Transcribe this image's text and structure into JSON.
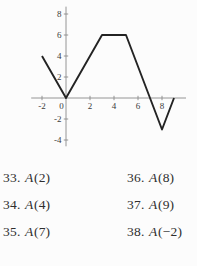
{
  "chart_data": {
    "type": "line",
    "title": "",
    "xlabel": "",
    "ylabel": "",
    "grid": false,
    "series": [
      {
        "name": "A(x)",
        "points": [
          [
            -2,
            4
          ],
          [
            0,
            0
          ],
          [
            3,
            6
          ],
          [
            5,
            6
          ],
          [
            8,
            -3
          ],
          [
            9,
            0
          ]
        ]
      }
    ],
    "x_ticks": [
      {
        "v": -2,
        "label": "-2"
      },
      {
        "v": 0,
        "label": "0"
      },
      {
        "v": 2,
        "label": "2"
      },
      {
        "v": 4,
        "label": "4"
      },
      {
        "v": 6,
        "label": "6"
      },
      {
        "v": 8,
        "label": "8"
      }
    ],
    "y_ticks": [
      {
        "v": 8,
        "label": "8"
      },
      {
        "v": 6,
        "label": "6"
      },
      {
        "v": 4,
        "label": "4"
      },
      {
        "v": 2,
        "label": "2"
      },
      {
        "v": -2,
        "label": "-2"
      },
      {
        "v": -4,
        "label": "-4"
      }
    ],
    "xlim": [
      -2.9,
      10.0
    ],
    "ylim": [
      -4.6,
      8.7
    ],
    "axis_color": "#8a8a8a",
    "line_color": "#232323",
    "tick_label_color": "#3b3b3b"
  },
  "exercises": {
    "left": [
      {
        "num": "33.",
        "func": "A",
        "arg": "(2)"
      },
      {
        "num": "34.",
        "func": "A",
        "arg": "(4)"
      },
      {
        "num": "35.",
        "func": "A",
        "arg": "(7)"
      }
    ],
    "right": [
      {
        "num": "36.",
        "func": "A",
        "arg": "(8)"
      },
      {
        "num": "37.",
        "func": "A",
        "arg": "(9)"
      },
      {
        "num": "38.",
        "func": "A",
        "arg": "(−2)"
      }
    ]
  }
}
